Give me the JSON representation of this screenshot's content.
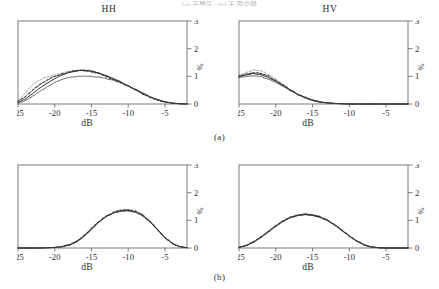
{
  "figure": {
    "top_caption_partial": "(a) 干旱区; (b) 干湿交替",
    "subcaptions": [
      {
        "id": "a",
        "label": "(a)"
      },
      {
        "id": "b",
        "label": "(b)"
      }
    ],
    "colors": {
      "axis": "#6e6e6e",
      "curve_dark": "#2b2b2b",
      "curve_mid": "#5a5a5a",
      "curve_light": "#8a8a8a",
      "text": "#2b2b2b",
      "background": "#ffffff"
    }
  },
  "axes": {
    "x_label": "dB",
    "y_label": "%",
    "x_ticks": [
      "-25",
      "-20",
      "-15",
      "-10",
      "-5"
    ],
    "x_tick_values": [
      -25,
      -20,
      -15,
      -10,
      -5
    ],
    "y_ticks": [
      "0",
      "1",
      "2",
      "3"
    ],
    "y_tick_values": [
      0,
      1,
      2,
      3
    ],
    "xlim": [
      -25,
      -2
    ],
    "ylim": [
      0,
      3
    ]
  },
  "chart_data": [
    {
      "id": "panel-a-hh",
      "type": "line",
      "title": "HH",
      "row": "a",
      "xlabel": "dB",
      "ylabel": "%",
      "xlim": [
        -25,
        -2
      ],
      "ylim": [
        0,
        3
      ],
      "grid": false,
      "legend": "none",
      "x": [
        -25,
        -24,
        -23,
        -22,
        -21,
        -20,
        -19,
        -18,
        -17,
        -16,
        -15,
        -14,
        -13,
        -12,
        -11,
        -10,
        -9,
        -8,
        -7,
        -6,
        -5,
        -4,
        -3,
        -2
      ],
      "series": [
        {
          "name": "curve-1",
          "style": "dashed-light",
          "values": [
            0.12,
            0.4,
            0.7,
            0.88,
            0.97,
            1.05,
            1.12,
            1.18,
            1.22,
            1.23,
            1.2,
            1.12,
            1.02,
            0.9,
            0.78,
            0.64,
            0.5,
            0.36,
            0.24,
            0.14,
            0.07,
            0.03,
            0.01,
            0.0
          ]
        },
        {
          "name": "curve-2",
          "style": "solid-dark",
          "values": [
            0.05,
            0.18,
            0.38,
            0.58,
            0.76,
            0.92,
            1.05,
            1.14,
            1.2,
            1.22,
            1.19,
            1.12,
            1.03,
            0.92,
            0.8,
            0.66,
            0.52,
            0.38,
            0.25,
            0.15,
            0.08,
            0.03,
            0.01,
            0.0
          ]
        },
        {
          "name": "curve-3",
          "style": "solid-mid",
          "values": [
            0.03,
            0.12,
            0.28,
            0.46,
            0.63,
            0.78,
            0.89,
            0.96,
            1.0,
            1.01,
            1.0,
            0.97,
            0.92,
            0.85,
            0.76,
            0.65,
            0.53,
            0.4,
            0.27,
            0.16,
            0.08,
            0.03,
            0.01,
            0.0
          ]
        },
        {
          "name": "curve-4",
          "style": "marker-dark",
          "values": [
            0.08,
            0.26,
            0.5,
            0.7,
            0.86,
            1.0,
            1.09,
            1.16,
            1.2,
            1.21,
            1.17,
            1.1,
            1.0,
            0.89,
            0.77,
            0.64,
            0.51,
            0.37,
            0.25,
            0.15,
            0.07,
            0.03,
            0.01,
            0.0
          ]
        }
      ]
    },
    {
      "id": "panel-a-hv",
      "type": "line",
      "title": "HV",
      "row": "a",
      "xlabel": "dB",
      "ylabel": "%",
      "xlim": [
        -25,
        -2
      ],
      "ylim": [
        0,
        3
      ],
      "grid": false,
      "legend": "none",
      "x": [
        -25,
        -24,
        -23,
        -22,
        -21,
        -20,
        -19,
        -18,
        -17,
        -16,
        -15,
        -14,
        -13,
        -12,
        -11,
        -10,
        -9,
        -8,
        -7,
        -6,
        -5,
        -4,
        -3,
        -2
      ],
      "series": [
        {
          "name": "curve-1",
          "style": "dashed-light",
          "values": [
            1.02,
            1.14,
            1.22,
            1.2,
            1.08,
            0.9,
            0.7,
            0.52,
            0.36,
            0.23,
            0.14,
            0.08,
            0.04,
            0.02,
            0.01,
            0.0,
            0.0,
            0.0,
            0.0,
            0.0,
            0.0,
            0.0,
            0.0,
            0.0
          ]
        },
        {
          "name": "curve-2",
          "style": "solid-dark",
          "values": [
            0.98,
            1.05,
            1.1,
            1.06,
            0.96,
            0.82,
            0.66,
            0.5,
            0.35,
            0.23,
            0.14,
            0.08,
            0.04,
            0.02,
            0.01,
            0.0,
            0.0,
            0.0,
            0.0,
            0.0,
            0.0,
            0.0,
            0.0,
            0.0
          ]
        },
        {
          "name": "curve-3",
          "style": "solid-mid",
          "values": [
            0.95,
            1.0,
            1.02,
            0.99,
            0.9,
            0.78,
            0.63,
            0.48,
            0.34,
            0.22,
            0.13,
            0.07,
            0.04,
            0.02,
            0.01,
            0.0,
            0.0,
            0.0,
            0.0,
            0.0,
            0.0,
            0.0,
            0.0,
            0.0
          ]
        },
        {
          "name": "curve-4",
          "style": "marker-dark",
          "values": [
            1.0,
            1.08,
            1.14,
            1.11,
            1.0,
            0.85,
            0.68,
            0.51,
            0.35,
            0.23,
            0.13,
            0.07,
            0.04,
            0.02,
            0.01,
            0.0,
            0.0,
            0.0,
            0.0,
            0.0,
            0.0,
            0.0,
            0.0,
            0.0
          ]
        }
      ]
    },
    {
      "id": "panel-b-hh",
      "type": "line",
      "title": "",
      "row": "b",
      "xlabel": "dB",
      "ylabel": "%",
      "xlim": [
        -25,
        -2
      ],
      "ylim": [
        0,
        3
      ],
      "grid": false,
      "legend": "none",
      "x": [
        -25,
        -24,
        -23,
        -22,
        -21,
        -20,
        -19,
        -18,
        -17,
        -16,
        -15,
        -14,
        -13,
        -12,
        -11,
        -10,
        -9,
        -8,
        -7,
        -6,
        -5,
        -4,
        -3,
        -2
      ],
      "series": [
        {
          "name": "curve-1",
          "style": "dashed-light",
          "values": [
            0.0,
            0.0,
            0.0,
            0.0,
            0.01,
            0.02,
            0.05,
            0.12,
            0.26,
            0.47,
            0.72,
            0.97,
            1.16,
            1.3,
            1.38,
            1.4,
            1.36,
            1.22,
            0.98,
            0.68,
            0.38,
            0.16,
            0.05,
            0.01
          ]
        },
        {
          "name": "curve-2",
          "style": "solid-dark",
          "values": [
            0.0,
            0.0,
            0.0,
            0.0,
            0.01,
            0.02,
            0.05,
            0.11,
            0.23,
            0.43,
            0.68,
            0.94,
            1.14,
            1.27,
            1.34,
            1.35,
            1.3,
            1.16,
            0.94,
            0.66,
            0.37,
            0.16,
            0.05,
            0.01
          ]
        },
        {
          "name": "curve-3",
          "style": "solid-mid",
          "values": [
            0.0,
            0.0,
            0.0,
            0.0,
            0.01,
            0.02,
            0.04,
            0.1,
            0.22,
            0.42,
            0.67,
            0.93,
            1.13,
            1.26,
            1.33,
            1.34,
            1.29,
            1.15,
            0.93,
            0.65,
            0.37,
            0.16,
            0.05,
            0.01
          ]
        },
        {
          "name": "curve-4",
          "style": "marker-dark",
          "values": [
            0.0,
            0.0,
            0.0,
            0.0,
            0.01,
            0.02,
            0.05,
            0.11,
            0.24,
            0.45,
            0.7,
            0.95,
            1.15,
            1.28,
            1.36,
            1.37,
            1.32,
            1.18,
            0.95,
            0.66,
            0.37,
            0.16,
            0.05,
            0.01
          ]
        }
      ]
    },
    {
      "id": "panel-b-hv",
      "type": "line",
      "title": "",
      "row": "b",
      "xlabel": "dB",
      "ylabel": "%",
      "xlim": [
        -25,
        -2
      ],
      "ylim": [
        0,
        3
      ],
      "grid": false,
      "legend": "none",
      "x": [
        -25,
        -24,
        -23,
        -22,
        -21,
        -20,
        -19,
        -18,
        -17,
        -16,
        -15,
        -14,
        -13,
        -12,
        -11,
        -10,
        -9,
        -8,
        -7,
        -6,
        -5,
        -4,
        -3,
        -2
      ],
      "series": [
        {
          "name": "curve-1",
          "style": "dashed-light",
          "values": [
            0.02,
            0.1,
            0.24,
            0.42,
            0.62,
            0.82,
            0.99,
            1.12,
            1.2,
            1.23,
            1.21,
            1.14,
            1.02,
            0.86,
            0.66,
            0.45,
            0.26,
            0.12,
            0.04,
            0.01,
            0.0,
            0.0,
            0.0,
            0.0
          ]
        },
        {
          "name": "curve-2",
          "style": "solid-dark",
          "values": [
            0.02,
            0.09,
            0.22,
            0.39,
            0.59,
            0.79,
            0.97,
            1.1,
            1.18,
            1.21,
            1.19,
            1.12,
            1.0,
            0.84,
            0.64,
            0.44,
            0.26,
            0.12,
            0.04,
            0.01,
            0.0,
            0.0,
            0.0,
            0.0
          ]
        },
        {
          "name": "curve-3",
          "style": "solid-mid",
          "values": [
            0.02,
            0.09,
            0.21,
            0.38,
            0.58,
            0.78,
            0.96,
            1.09,
            1.17,
            1.2,
            1.18,
            1.11,
            0.99,
            0.83,
            0.63,
            0.43,
            0.25,
            0.11,
            0.04,
            0.01,
            0.0,
            0.0,
            0.0,
            0.0
          ]
        },
        {
          "name": "curve-4",
          "style": "marker-dark",
          "values": [
            0.02,
            0.1,
            0.23,
            0.4,
            0.6,
            0.8,
            0.98,
            1.11,
            1.19,
            1.22,
            1.2,
            1.13,
            1.01,
            0.85,
            0.65,
            0.44,
            0.26,
            0.12,
            0.04,
            0.01,
            0.0,
            0.0,
            0.0,
            0.0
          ]
        }
      ]
    }
  ]
}
